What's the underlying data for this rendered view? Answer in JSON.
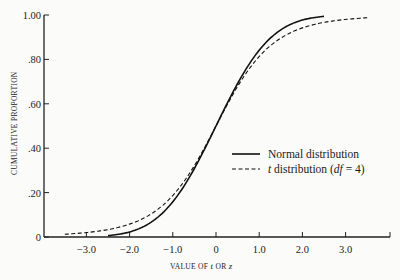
{
  "chart_data": {
    "type": "line",
    "title": "",
    "xlabel": "VALUE OF t OR z",
    "xlabel_parts": [
      "VALUE OF ",
      "t",
      " OR ",
      "z"
    ],
    "ylabel": "CUMULATIVE PROPORTION",
    "xlim": [
      -4.0,
      4.0
    ],
    "ylim": [
      0,
      1.0
    ],
    "xticks": [
      -3.0,
      -2.0,
      -1.0,
      0,
      1.0,
      2.0,
      3.0
    ],
    "xtick_labels": [
      "−3.0",
      "−2.0",
      "−1.0",
      "0",
      "1.0",
      "2.0",
      "3.0"
    ],
    "yticks": [
      0,
      0.2,
      0.4,
      0.6,
      0.8,
      1.0
    ],
    "ytick_labels": [
      "0",
      ".20",
      ".40",
      ".60",
      ".80",
      "1.00"
    ],
    "grid": false,
    "legend_position": "center-right",
    "series": [
      {
        "name": "Normal distribution",
        "style": "solid",
        "x_range": [
          -2.5,
          2.5
        ],
        "x": [
          -2.5,
          -2.0,
          -1.5,
          -1.0,
          -0.5,
          0,
          0.5,
          1.0,
          1.5,
          2.0,
          2.5
        ],
        "y": [
          0.006,
          0.023,
          0.067,
          0.159,
          0.309,
          0.5,
          0.691,
          0.841,
          0.933,
          0.977,
          0.994
        ]
      },
      {
        "name": "t distribution (df=4)",
        "style": "dashed",
        "x_range": [
          -3.5,
          3.5
        ],
        "x": [
          -3.5,
          -3.0,
          -2.5,
          -2.0,
          -1.5,
          -1.0,
          -0.5,
          0,
          0.5,
          1.0,
          1.5,
          2.0,
          2.5,
          3.0,
          3.5
        ],
        "y": [
          0.012,
          0.02,
          0.033,
          0.058,
          0.104,
          0.187,
          0.322,
          0.5,
          0.678,
          0.813,
          0.896,
          0.942,
          0.967,
          0.98,
          0.988
        ]
      }
    ],
    "legend": [
      {
        "label_prefix": "Normal distribution",
        "style": "solid"
      },
      {
        "label_prefix": "t",
        "label_mid": " distribution (",
        "label_italic": "df",
        "label_suffix": " = 4)",
        "style": "dashed"
      }
    ]
  }
}
